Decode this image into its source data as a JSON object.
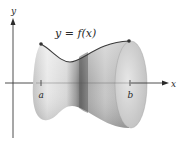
{
  "figure": {
    "type": "solid-of-revolution",
    "curve_label": "y = f(x)",
    "axis_x_label": "x",
    "axis_y_label": "y",
    "lower_bound_label": "a",
    "upper_bound_label": "b",
    "colors": {
      "axes": "#3a3a3a",
      "curve": "#3b3b3b",
      "surface_light": "#e8e8e8",
      "surface_mid": "#b5b5b5",
      "surface_dark": "#6f6f6f",
      "cap": "#d4d4d4",
      "points": "#333333"
    }
  }
}
